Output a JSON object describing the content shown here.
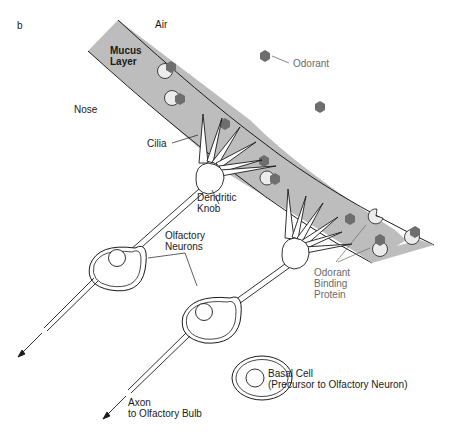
{
  "figure": {
    "panel_letter": "b",
    "regions": {
      "air": "Air",
      "nose": "Nose"
    },
    "labels": {
      "mucus_layer": [
        "Mucus",
        "Layer"
      ],
      "odorant": "Odorant",
      "cilia": "Cilia",
      "dendritic_knob": [
        "Dendritic",
        "Knob"
      ],
      "olfactory_neurons": [
        "Olfactory",
        "Neurons"
      ],
      "odorant_binding_protein": [
        "Odorant",
        "Binding",
        "Protein"
      ],
      "basal_cell": [
        "Basal Cell",
        "(Precursor to Olfactory Neuron)"
      ],
      "axon": [
        "Axon",
        "to Olfactory Bulb"
      ]
    },
    "colors": {
      "mucus_fill": "#bdbdbd",
      "outline": "#1a1a1a",
      "odorant": "#6e6e6e",
      "binding_protein": "#ececec",
      "grey_text": "#6a6a6a"
    }
  }
}
